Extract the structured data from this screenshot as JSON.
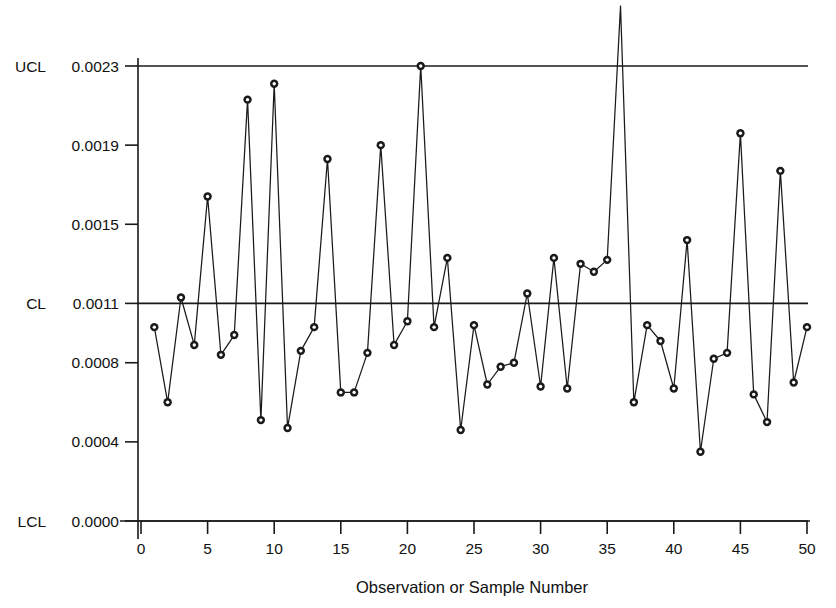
{
  "chart_data": {
    "type": "line",
    "title": "",
    "xlabel": "Observation or Sample Number",
    "ylabel": "",
    "xlim": [
      0,
      51
    ],
    "ylim": [
      0.0,
      0.0023
    ],
    "grid": false,
    "legend": "none",
    "x_ticks": [
      "0",
      "5",
      "10",
      "15",
      "20",
      "25",
      "30",
      "35",
      "40",
      "45",
      "50"
    ],
    "x_tick_values": [
      0,
      5,
      10,
      15,
      20,
      25,
      30,
      35,
      40,
      45,
      50
    ],
    "y_ticks": [
      "0.0023",
      "0.0019",
      "0.0015",
      "0.0011",
      "0.0008",
      "0.0004",
      "0.0000"
    ],
    "y_tick_values": [
      0.0023,
      0.0019,
      0.0015,
      0.0011,
      0.0008,
      0.0004,
      0.0
    ],
    "control_limits": {
      "ucl_label": "UCL",
      "ucl_value_label": "0.0023",
      "ucl_value": 0.0023,
      "cl_label": "CL",
      "cl_value_label": "0.0011",
      "cl_value": 0.0011,
      "lcl_label": "LCL",
      "lcl_value_label": "0.0000",
      "lcl_value": 0.0
    },
    "series": [
      {
        "name": "fraction-nonconforming",
        "x": [
          1,
          2,
          3,
          4,
          5,
          6,
          7,
          8,
          9,
          10,
          11,
          12,
          13,
          14,
          15,
          16,
          17,
          18,
          19,
          20,
          21,
          22,
          23,
          24,
          25,
          26,
          27,
          28,
          29,
          30,
          31,
          32,
          33,
          34,
          35,
          36,
          37,
          38,
          39,
          40,
          41,
          42,
          43,
          44,
          45,
          46,
          47,
          48,
          49,
          50
        ],
        "values": [
          0.00098,
          0.0006,
          0.00113,
          0.00089,
          0.00164,
          0.00084,
          0.00094,
          0.00213,
          0.00051,
          0.00221,
          0.00047,
          0.00086,
          0.00098,
          0.00183,
          0.00065,
          0.00065,
          0.00085,
          0.0019,
          0.00089,
          0.00101,
          0.0023,
          0.00098,
          0.00133,
          0.00046,
          0.00099,
          0.00069,
          0.00078,
          0.0008,
          0.00115,
          0.00068,
          0.00133,
          0.00067,
          0.0013,
          0.00126,
          0.00132,
          0.00275,
          0.0006,
          0.00099,
          0.00091,
          0.00067,
          0.00142,
          0.00035,
          0.00082,
          0.00085,
          0.00196,
          0.00064,
          0.0005,
          0.00177,
          0.0007,
          0.00098
        ]
      }
    ]
  }
}
